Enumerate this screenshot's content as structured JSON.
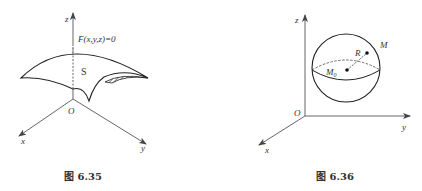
{
  "figures": [
    {
      "id": "fig-6-35",
      "caption": "图 6.35",
      "axes": {
        "x": "x",
        "y": "y",
        "z": "z",
        "origin": "O"
      },
      "equation": "F(x,y,z)=0",
      "surface_label": "S"
    },
    {
      "id": "fig-6-36",
      "caption": "图 6.36",
      "axes": {
        "x": "x",
        "y": "y",
        "z": "z",
        "origin": "O"
      },
      "center_point": "M",
      "center_subscript": "0",
      "surface_point": "M",
      "radius_label": "R"
    }
  ],
  "colors": {
    "stroke": "#333333",
    "axis": "#555555",
    "background": "#ffffff"
  }
}
